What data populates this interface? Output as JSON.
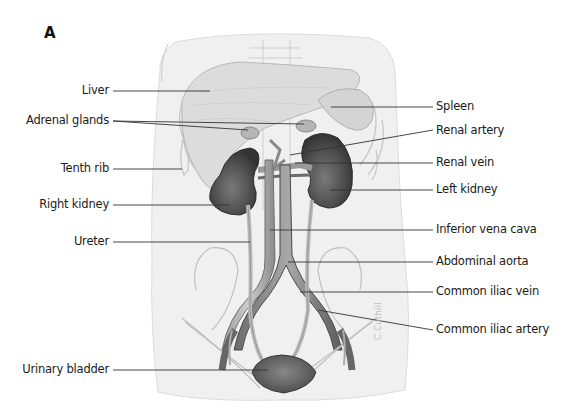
{
  "figure": {
    "panel_letter": "A",
    "signature": "C.Cuthill",
    "labels_left": [
      {
        "id": "liver",
        "text": "Liver"
      },
      {
        "id": "adrenal-glands",
        "text": "Adrenal glands"
      },
      {
        "id": "tenth-rib",
        "text": "Tenth rib"
      },
      {
        "id": "right-kidney",
        "text": "Right kidney"
      },
      {
        "id": "ureter",
        "text": "Ureter"
      },
      {
        "id": "urinary-bladder",
        "text": "Urinary bladder"
      }
    ],
    "labels_right": [
      {
        "id": "spleen",
        "text": "Spleen"
      },
      {
        "id": "renal-artery",
        "text": "Renal artery"
      },
      {
        "id": "renal-vein",
        "text": "Renal vein"
      },
      {
        "id": "left-kidney",
        "text": "Left kidney"
      },
      {
        "id": "inferior-vena-cava",
        "text": "Inferior vena cava"
      },
      {
        "id": "abdominal-aorta",
        "text": "Abdominal aorta"
      },
      {
        "id": "common-iliac-vein",
        "text": "Common iliac vein"
      },
      {
        "id": "common-iliac-artery",
        "text": "Common iliac artery"
      }
    ]
  }
}
